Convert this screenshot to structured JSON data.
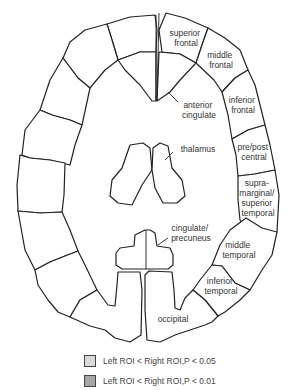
{
  "colors": {
    "light_shade": "#d9d9d9",
    "dark_shade": "#a6a6a6",
    "white": "#ffffff",
    "line": "#222222"
  },
  "regions": {
    "left": [
      {
        "id": "L-superior-frontal",
        "shade": "none"
      },
      {
        "id": "L-middle-frontal",
        "shade": "none"
      },
      {
        "id": "L-inferior-frontal",
        "shade": "light"
      },
      {
        "id": "L-pre-post-central",
        "shade": "none"
      },
      {
        "id": "L-supramarginal-superior-temporal",
        "shade": "dark"
      },
      {
        "id": "L-middle-temporal",
        "shade": "dark"
      },
      {
        "id": "L-inferior-temporal",
        "shade": "none"
      },
      {
        "id": "L-occipital",
        "shade": "none"
      },
      {
        "id": "L-anterior-cingulate",
        "shade": "dark"
      },
      {
        "id": "L-thalamus",
        "shade": "none"
      },
      {
        "id": "L-cingulate-precuneus",
        "shade": "none"
      }
    ],
    "right_labels": {
      "superior_frontal": [
        "superior",
        "frontal"
      ],
      "middle_frontal": [
        "middle",
        "frontal"
      ],
      "inferior_frontal": [
        "inferior",
        "frontal"
      ],
      "pre_post_central": [
        "pre/post",
        "central"
      ],
      "supramarginal": [
        "supra-",
        "marginal/",
        "superior",
        "temporal"
      ],
      "middle_temporal": [
        "middle",
        "temporal"
      ],
      "inferior_temporal": [
        "inferior",
        "temporal"
      ],
      "occipital": [
        "occipital"
      ],
      "anterior_cingulate": [
        "anterior",
        "cingulate"
      ],
      "thalamus": [
        "thalamus"
      ],
      "cingulate_precuneus": [
        "cingulate/",
        "precuneus"
      ]
    }
  },
  "legend": [
    {
      "label": "Left ROI < Right ROI,P < 0.05",
      "color": "#d9d9d9"
    },
    {
      "label": "Left ROI < Right ROI,P < 0.01",
      "color": "#a6a6a6"
    }
  ]
}
